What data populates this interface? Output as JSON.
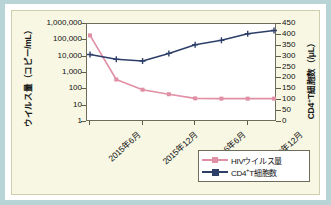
{
  "figure": {
    "frame_bg": "#ffffff",
    "page_bg": "#b9d4d6",
    "plot_bg": "#f7f7e3"
  },
  "chart_data": {
    "type": "line",
    "title": "",
    "xlabel": "",
    "grid": false,
    "legend_position": "bottom-right",
    "x": [
      0,
      1,
      2,
      3,
      4,
      5,
      6,
      7
    ],
    "categories": [
      "2015年6月",
      "",
      "2015年12月",
      "",
      "2016年6月",
      "",
      "2016年12月",
      ""
    ],
    "xtick_labels": [
      "2015年6月",
      "2015年12月",
      "2016年6月",
      "2016年12月"
    ],
    "xtick_positions": [
      0,
      2,
      4,
      6
    ],
    "left_axis": {
      "label": "ウイルス量（コピー/mL）",
      "scale": "log",
      "ylim": [
        1,
        1000000
      ],
      "ticks": [
        1000000,
        100000,
        10000,
        1000,
        100,
        10,
        1
      ],
      "tick_labels": [
        "1,000,000",
        "100,000",
        "10,000",
        "1,000",
        "100",
        "10",
        "1"
      ]
    },
    "right_axis": {
      "label": "CD4⁺T細胞数（/μL）",
      "scale": "linear",
      "ylim": [
        0,
        450
      ],
      "ticks": [
        450,
        400,
        350,
        300,
        250,
        200,
        150,
        100,
        50,
        0
      ],
      "tick_labels": [
        "450",
        "400",
        "350",
        "300",
        "250",
        "200",
        "150",
        "100",
        "50",
        "0"
      ]
    },
    "series": [
      {
        "name": "HIVウイルス量",
        "axis": "left",
        "color": "#e08fa4",
        "marker": "square",
        "values": [
          200000,
          400,
          95,
          50,
          28,
          27,
          27,
          27
        ]
      },
      {
        "name": "CD4⁺T細胞数",
        "axis": "right",
        "color": "#2d3f69",
        "marker": "plus",
        "values": [
          310,
          288,
          280,
          315,
          355,
          375,
          405,
          420
        ]
      }
    ]
  },
  "legend": {
    "items": [
      {
        "label_main": "HIVウイルス量",
        "label_sup": "",
        "label_tail": "",
        "color": "#e08fa4"
      },
      {
        "label_main": "CD4",
        "label_sup": "+",
        "label_tail": "T細胞数",
        "color": "#2d3f69"
      }
    ]
  }
}
